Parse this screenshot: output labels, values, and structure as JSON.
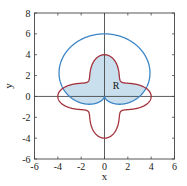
{
  "chart_data": {
    "type": "line",
    "title": "",
    "xlabel": "x",
    "ylabel": "y",
    "xlim": [
      -6,
      6
    ],
    "ylim": [
      -6,
      8
    ],
    "xticks": [
      -6,
      -4,
      -2,
      0,
      2,
      4,
      6
    ],
    "yticks": [
      -6,
      -4,
      -2,
      0,
      2,
      4,
      6,
      8
    ],
    "grid": false,
    "legend": null,
    "series": [
      {
        "name": "blue curve (cardioid)",
        "polar": "r = 3 + 3 sin(theta)",
        "a": 3,
        "b": 3,
        "func": "sin",
        "k": 1,
        "color": "#3d86c6",
        "extent": {
          "top_y": 6,
          "bottom_y": -0.75,
          "max_abs_x": 3.9
        }
      },
      {
        "name": "red curve (four-lobed)",
        "polar": "r = 3 + cos(4 theta)",
        "a": 3,
        "b": 1,
        "func": "cos",
        "k": 4,
        "color": "#a3313b",
        "extent": {
          "top_y": 4,
          "bottom_y": -4,
          "max_abs_x": 4
        }
      }
    ],
    "shaded_region": {
      "label": "R",
      "description": "region inside both curves",
      "fill": "#c9dfee",
      "label_pos": [
        1,
        1
      ]
    }
  }
}
